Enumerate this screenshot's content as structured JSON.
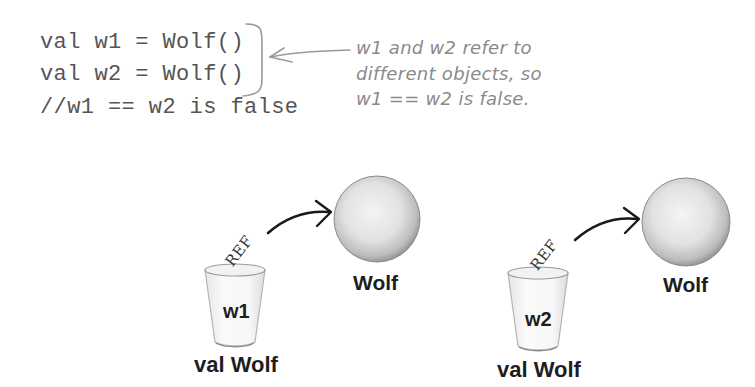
{
  "code": {
    "lines": [
      "val w1 = Wolf()",
      "val w2 = Wolf()",
      "//w1 == w2 is false"
    ]
  },
  "annotation": {
    "lines": [
      "w1 and w2 refer to",
      "different objects, so",
      "w1 == w2 is false."
    ],
    "color": "#8a8a8a"
  },
  "diagram": {
    "references": [
      {
        "variable_name": "w1",
        "variable_type": "val Wolf",
        "ref_label": "REF",
        "object_label": "Wolf"
      },
      {
        "variable_name": "w2",
        "variable_type": "val Wolf",
        "ref_label": "REF",
        "object_label": "Wolf"
      }
    ]
  },
  "icons": {
    "object": "sphere-icon",
    "variable": "cup-icon",
    "reference": "curved-arrow-icon"
  }
}
